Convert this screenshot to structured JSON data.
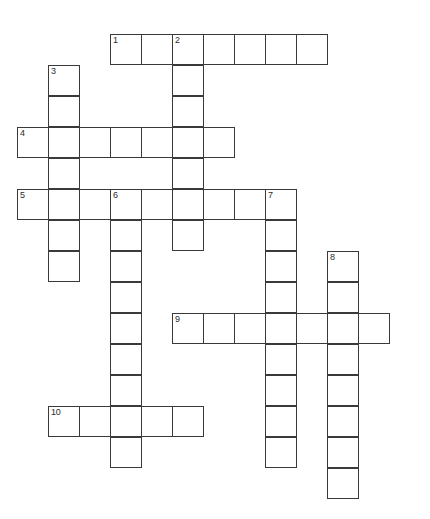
{
  "puzzle": {
    "title": "Crossword Puzzle Grid",
    "background_color": "#ffffff",
    "cell_border_color": "#3a3a3a",
    "number_color": "#2b2b2b",
    "cell_size": 31,
    "columns": 13,
    "rows": 16,
    "origin_x": 17,
    "origin_y": 34,
    "entries": [
      {
        "number": "1",
        "direction": "across",
        "row": 0,
        "col": 3,
        "length": 7
      },
      {
        "number": "2",
        "direction": "down",
        "row": 0,
        "col": 5,
        "length": 7
      },
      {
        "number": "3",
        "direction": "down",
        "row": 1,
        "col": 1,
        "length": 7
      },
      {
        "number": "4",
        "direction": "across",
        "row": 3,
        "col": 0,
        "length": 7
      },
      {
        "number": "5",
        "direction": "across",
        "row": 5,
        "col": 0,
        "length": 9
      },
      {
        "number": "6",
        "direction": "down",
        "row": 5,
        "col": 3,
        "length": 9
      },
      {
        "number": "7",
        "direction": "down",
        "row": 5,
        "col": 8,
        "length": 9
      },
      {
        "number": "8",
        "direction": "down",
        "row": 7,
        "col": 10,
        "length": 8
      },
      {
        "number": "9",
        "direction": "across",
        "row": 9,
        "col": 5,
        "length": 7
      },
      {
        "number": "10",
        "direction": "across",
        "row": 12,
        "col": 1,
        "length": 5
      }
    ],
    "cells": [
      {
        "row": 0,
        "col": 3,
        "number": "1",
        "letter": ""
      },
      {
        "row": 0,
        "col": 4,
        "number": "",
        "letter": ""
      },
      {
        "row": 0,
        "col": 5,
        "number": "2",
        "letter": ""
      },
      {
        "row": 0,
        "col": 6,
        "number": "",
        "letter": ""
      },
      {
        "row": 0,
        "col": 7,
        "number": "",
        "letter": ""
      },
      {
        "row": 0,
        "col": 8,
        "number": "",
        "letter": ""
      },
      {
        "row": 0,
        "col": 9,
        "number": "",
        "letter": ""
      },
      {
        "row": 1,
        "col": 1,
        "number": "3",
        "letter": ""
      },
      {
        "row": 1,
        "col": 5,
        "number": "",
        "letter": ""
      },
      {
        "row": 2,
        "col": 1,
        "number": "",
        "letter": ""
      },
      {
        "row": 2,
        "col": 5,
        "number": "",
        "letter": ""
      },
      {
        "row": 3,
        "col": 0,
        "number": "4",
        "letter": ""
      },
      {
        "row": 3,
        "col": 1,
        "number": "",
        "letter": ""
      },
      {
        "row": 3,
        "col": 2,
        "number": "",
        "letter": ""
      },
      {
        "row": 3,
        "col": 3,
        "number": "",
        "letter": ""
      },
      {
        "row": 3,
        "col": 4,
        "number": "",
        "letter": ""
      },
      {
        "row": 3,
        "col": 5,
        "number": "",
        "letter": ""
      },
      {
        "row": 3,
        "col": 6,
        "number": "",
        "letter": ""
      },
      {
        "row": 4,
        "col": 1,
        "number": "",
        "letter": ""
      },
      {
        "row": 4,
        "col": 5,
        "number": "",
        "letter": ""
      },
      {
        "row": 5,
        "col": 0,
        "number": "5",
        "letter": ""
      },
      {
        "row": 5,
        "col": 1,
        "number": "",
        "letter": ""
      },
      {
        "row": 5,
        "col": 2,
        "number": "",
        "letter": ""
      },
      {
        "row": 5,
        "col": 3,
        "number": "6",
        "letter": ""
      },
      {
        "row": 5,
        "col": 4,
        "number": "",
        "letter": ""
      },
      {
        "row": 5,
        "col": 5,
        "number": "",
        "letter": ""
      },
      {
        "row": 5,
        "col": 6,
        "number": "",
        "letter": ""
      },
      {
        "row": 5,
        "col": 7,
        "number": "",
        "letter": ""
      },
      {
        "row": 5,
        "col": 8,
        "number": "7",
        "letter": ""
      },
      {
        "row": 6,
        "col": 1,
        "number": "",
        "letter": ""
      },
      {
        "row": 6,
        "col": 3,
        "number": "",
        "letter": ""
      },
      {
        "row": 6,
        "col": 5,
        "number": "",
        "letter": ""
      },
      {
        "row": 6,
        "col": 8,
        "number": "",
        "letter": ""
      },
      {
        "row": 7,
        "col": 1,
        "number": "",
        "letter": ""
      },
      {
        "row": 7,
        "col": 3,
        "number": "",
        "letter": ""
      },
      {
        "row": 7,
        "col": 8,
        "number": "",
        "letter": ""
      },
      {
        "row": 7,
        "col": 10,
        "number": "8",
        "letter": ""
      },
      {
        "row": 8,
        "col": 3,
        "number": "",
        "letter": ""
      },
      {
        "row": 8,
        "col": 8,
        "number": "",
        "letter": ""
      },
      {
        "row": 8,
        "col": 10,
        "number": "",
        "letter": ""
      },
      {
        "row": 9,
        "col": 3,
        "number": "",
        "letter": ""
      },
      {
        "row": 9,
        "col": 5,
        "number": "9",
        "letter": ""
      },
      {
        "row": 9,
        "col": 6,
        "number": "",
        "letter": ""
      },
      {
        "row": 9,
        "col": 7,
        "number": "",
        "letter": ""
      },
      {
        "row": 9,
        "col": 8,
        "number": "",
        "letter": ""
      },
      {
        "row": 9,
        "col": 9,
        "number": "",
        "letter": ""
      },
      {
        "row": 9,
        "col": 10,
        "number": "",
        "letter": ""
      },
      {
        "row": 9,
        "col": 11,
        "number": "",
        "letter": ""
      },
      {
        "row": 10,
        "col": 3,
        "number": "",
        "letter": ""
      },
      {
        "row": 10,
        "col": 8,
        "number": "",
        "letter": ""
      },
      {
        "row": 10,
        "col": 10,
        "number": "",
        "letter": ""
      },
      {
        "row": 11,
        "col": 3,
        "number": "",
        "letter": ""
      },
      {
        "row": 11,
        "col": 8,
        "number": "",
        "letter": ""
      },
      {
        "row": 11,
        "col": 10,
        "number": "",
        "letter": ""
      },
      {
        "row": 12,
        "col": 1,
        "number": "10",
        "letter": ""
      },
      {
        "row": 12,
        "col": 2,
        "number": "",
        "letter": ""
      },
      {
        "row": 12,
        "col": 3,
        "number": "",
        "letter": ""
      },
      {
        "row": 12,
        "col": 4,
        "number": "",
        "letter": ""
      },
      {
        "row": 12,
        "col": 5,
        "number": "",
        "letter": ""
      },
      {
        "row": 12,
        "col": 8,
        "number": "",
        "letter": ""
      },
      {
        "row": 12,
        "col": 10,
        "number": "",
        "letter": ""
      },
      {
        "row": 13,
        "col": 3,
        "number": "",
        "letter": ""
      },
      {
        "row": 13,
        "col": 8,
        "number": "",
        "letter": ""
      },
      {
        "row": 13,
        "col": 10,
        "number": "",
        "letter": ""
      },
      {
        "row": 14,
        "col": 10,
        "number": "",
        "letter": ""
      }
    ]
  }
}
